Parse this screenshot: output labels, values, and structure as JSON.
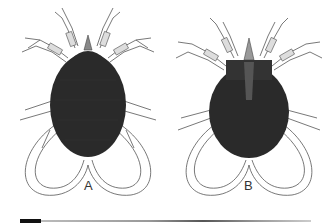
{
  "figure": {
    "panels": [
      {
        "label": "A",
        "view": "dorsal"
      },
      {
        "label": "B",
        "view": "ventral"
      }
    ]
  },
  "colors": {
    "body": "#2a2a2a",
    "legs": "#555555",
    "background": "#ffffff"
  }
}
